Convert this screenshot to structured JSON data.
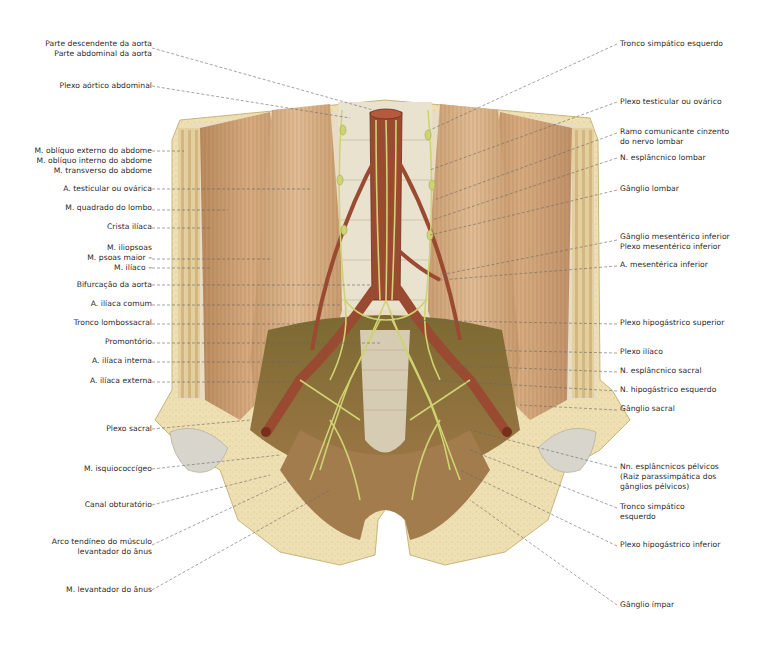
{
  "figure": {
    "type": "anatomical-illustration",
    "colors": {
      "background": "#ffffff",
      "muscle": "#c9986a",
      "muscle_dark": "#a9764a",
      "fascia": "#e6dcc6",
      "bone": "#eee0b2",
      "artery": "#9b4a32",
      "nerve": "#cfd372",
      "leader_line": "#666666",
      "label_text": "#2a2a2a"
    },
    "labels_left": [
      {
        "id": "l1",
        "lines": [
          "Parte descendente da aorta",
          "Parte abdominal da aorta"
        ]
      },
      {
        "id": "l2",
        "lines": [
          "Plexo aórtico abdominal"
        ]
      },
      {
        "id": "l3",
        "lines": [
          "M. oblíquo externo do abdome",
          "M. oblíquo interno do abdome",
          "M. transverso do abdome"
        ]
      },
      {
        "id": "l4",
        "lines": [
          "A. testicular ou ovárica"
        ]
      },
      {
        "id": "l5",
        "lines": [
          "M. quadrado do lombo"
        ]
      },
      {
        "id": "l6",
        "lines": [
          "Crista ilíaca"
        ]
      },
      {
        "id": "l7",
        "lines": [
          "M. iliopsoas",
          "M. psoas maior –",
          "M. ilíaco –"
        ]
      },
      {
        "id": "l8",
        "lines": [
          "Bifurcação da aorta"
        ]
      },
      {
        "id": "l9",
        "lines": [
          "A. ilíaca comum"
        ]
      },
      {
        "id": "l10",
        "lines": [
          "Tronco lombossacral"
        ]
      },
      {
        "id": "l11",
        "lines": [
          "Promontório"
        ]
      },
      {
        "id": "l12",
        "lines": [
          "A. ilíaca interna"
        ]
      },
      {
        "id": "l13",
        "lines": [
          "A. ilíaca externa"
        ]
      },
      {
        "id": "l14",
        "lines": [
          "Plexo sacral"
        ]
      },
      {
        "id": "l15",
        "lines": [
          "M. isquiococcígeo"
        ]
      },
      {
        "id": "l16",
        "lines": [
          "Canal obturatório"
        ]
      },
      {
        "id": "l17",
        "lines": [
          "Arco tendíneo do músculo",
          "levantador do ânus"
        ]
      },
      {
        "id": "l18",
        "lines": [
          "M. levantador do ânus"
        ]
      }
    ],
    "labels_right": [
      {
        "id": "r1",
        "lines": [
          "Tronco simpático esquerdo"
        ]
      },
      {
        "id": "r2",
        "lines": [
          "Plexo testicular ou ovárico"
        ]
      },
      {
        "id": "r3",
        "lines": [
          "Ramo comunicante cinzento",
          "do nervo lombar"
        ]
      },
      {
        "id": "r4",
        "lines": [
          "N. esplâncnico lombar"
        ]
      },
      {
        "id": "r5",
        "lines": [
          "Gânglio lombar"
        ]
      },
      {
        "id": "r6",
        "lines": [
          "Gânglio mesentérico inferior",
          "Plexo mesentérico inferior"
        ]
      },
      {
        "id": "r7",
        "lines": [
          "A. mesentérica inferior"
        ]
      },
      {
        "id": "r8",
        "lines": [
          "Plexo hipogástrico superior"
        ]
      },
      {
        "id": "r9",
        "lines": [
          "Plexo ilíaco"
        ]
      },
      {
        "id": "r10",
        "lines": [
          "N. esplâncnico sacral"
        ]
      },
      {
        "id": "r11",
        "lines": [
          "N. hipogástrico esquerdo"
        ]
      },
      {
        "id": "r12",
        "lines": [
          "Gânglio sacral"
        ]
      },
      {
        "id": "r13",
        "lines": [
          "Nn. esplâncnicos pélvicos",
          "(Raiz parassimpática dos",
          "gânglios pélvicos)"
        ]
      },
      {
        "id": "r14",
        "lines": [
          "Tronco simpático",
          "esquerdo"
        ]
      },
      {
        "id": "r15",
        "lines": [
          "Plexo hipogástrico inferior"
        ]
      },
      {
        "id": "r16",
        "lines": [
          "Gânglio ímpar"
        ]
      }
    ]
  }
}
